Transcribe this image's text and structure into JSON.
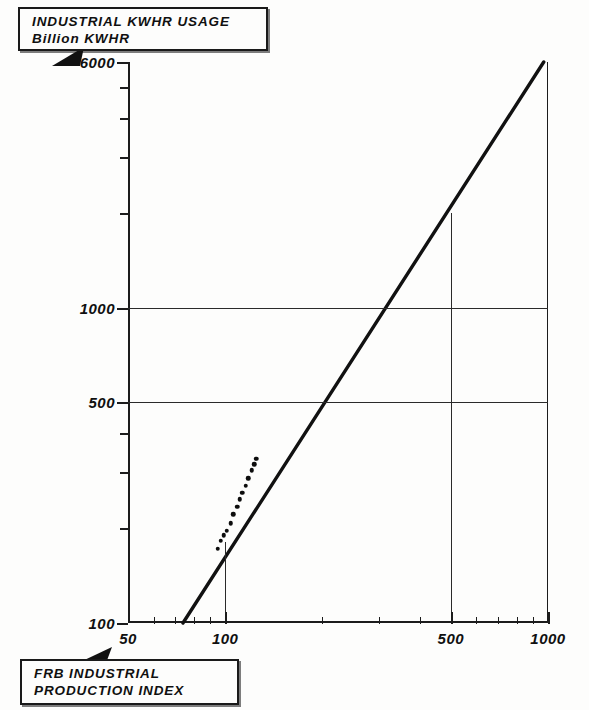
{
  "title_callout": {
    "line1": "INDUSTRIAL KWHR USAGE",
    "line2": "Billion KWHR"
  },
  "xlabel_callout": {
    "line1": "FRB INDUSTRIAL",
    "line2": "PRODUCTION INDEX"
  },
  "chart_data": {
    "type": "scatter",
    "title": "INDUSTRIAL KWHR USAGE",
    "subtitle": "Billion KWHR",
    "xlabel": "FRB INDUSTRIAL PRODUCTION INDEX",
    "ylabel": "Billion KWHR",
    "xscale": "log",
    "yscale": "log",
    "xlim": [
      50,
      1000
    ],
    "ylim": [
      100,
      6000
    ],
    "grid": true,
    "legend": "none",
    "x_tick_labels": [
      "50",
      "100",
      "500",
      "1000"
    ],
    "x_tick_values": [
      50,
      100,
      500,
      1000
    ],
    "x_minor_ticks": [
      60,
      70,
      80,
      90,
      200,
      300,
      400,
      600,
      700,
      800,
      900
    ],
    "y_tick_labels": [
      "100",
      "500",
      "1000",
      "6000"
    ],
    "y_tick_values": [
      100,
      500,
      1000,
      6000
    ],
    "y_minor_ticks": [
      200,
      300,
      400,
      2000,
      3000,
      4000,
      5000
    ],
    "gridlines_h": [
      500,
      1000
    ],
    "reference_lines": [
      {
        "x": 100,
        "y_top": 180
      },
      {
        "x": 500,
        "y_top": 2000
      }
    ],
    "fit_line": {
      "label": "fitted trend line",
      "x_start": 74,
      "y_start": 100,
      "x_end": 970,
      "y_end": 6000
    },
    "points": [
      {
        "x": 95,
        "y": 172
      },
      {
        "x": 97,
        "y": 182
      },
      {
        "x": 99,
        "y": 190
      },
      {
        "x": 101,
        "y": 196
      },
      {
        "x": 104,
        "y": 207
      },
      {
        "x": 106,
        "y": 221
      },
      {
        "x": 109,
        "y": 234
      },
      {
        "x": 111,
        "y": 247
      },
      {
        "x": 113,
        "y": 259
      },
      {
        "x": 116,
        "y": 272
      },
      {
        "x": 118,
        "y": 288
      },
      {
        "x": 121,
        "y": 305
      },
      {
        "x": 123,
        "y": 318
      },
      {
        "x": 125,
        "y": 332
      }
    ]
  },
  "colors": {
    "background": "#fdfdfc",
    "ink": "#101010",
    "grid": "#2a2a2a",
    "fit_line": "#111111"
  }
}
